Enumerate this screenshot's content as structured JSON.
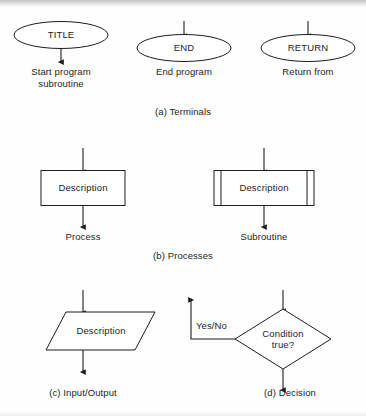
{
  "figure": {
    "background_color": "#fefefe",
    "ink_color": "#1d1d1d",
    "groups": [
      {
        "id": "terminals",
        "caption": "(a) Terminals",
        "symbols": [
          {
            "id": "title-terminal",
            "shape": "ellipse",
            "shape_text": "TITLE",
            "label": "Start program\nsubroutine",
            "arrow": "exit-down"
          },
          {
            "id": "end-terminal",
            "shape": "ellipse",
            "shape_text": "END",
            "label": "End program",
            "arrow": "enter-top"
          },
          {
            "id": "return-terminal",
            "shape": "ellipse",
            "shape_text": "RETURN",
            "label": "Return from",
            "arrow": "enter-top"
          }
        ]
      },
      {
        "id": "processes",
        "caption": "(b) Processes",
        "symbols": [
          {
            "id": "process-box",
            "shape": "rectangle",
            "shape_text": "Description",
            "label": "Process",
            "arrow": "through"
          },
          {
            "id": "subroutine-box",
            "shape": "double-sided-rectangle",
            "shape_text": "Description",
            "label": "Subroutine",
            "arrow": "through"
          }
        ]
      },
      {
        "id": "input-output",
        "caption": "(c) Input/Output",
        "symbols": [
          {
            "id": "io-parallelogram",
            "shape": "parallelogram",
            "shape_text": "Description",
            "label": "",
            "arrow": "through"
          }
        ]
      },
      {
        "id": "decision",
        "caption": "(d) Decision",
        "symbols": [
          {
            "id": "decision-diamond",
            "shape": "diamond",
            "shape_text": "Condition\ntrue?",
            "label": "",
            "arrow": "enter-top-exit-bottom-and-left",
            "branch_label": "Yes/No"
          }
        ]
      }
    ]
  }
}
